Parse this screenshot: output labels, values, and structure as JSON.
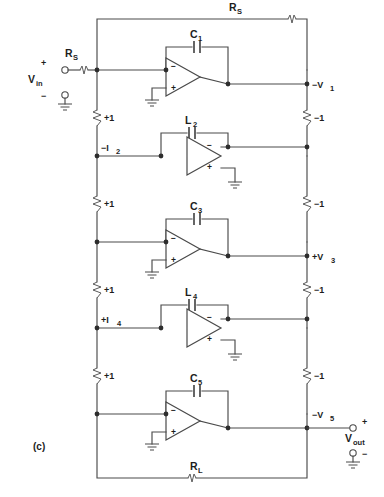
{
  "figure": {
    "label": "(c)",
    "caption_id": "c"
  },
  "source": {
    "signal_label": "V",
    "signal_sub": "in",
    "plus": "+",
    "minus": "−",
    "series_resistor": "R",
    "series_resistor_sub": "S"
  },
  "output": {
    "signal_label": "V",
    "signal_sub": "out",
    "plus": "+",
    "minus": "−"
  },
  "feedback": {
    "top_resistor": "R",
    "top_resistor_sub": "S",
    "bottom_resistor": "R",
    "bottom_resistor_sub": "L"
  },
  "stages": [
    {
      "component": "C",
      "component_sub": "1",
      "component_type": "capacitor",
      "orientation": "standard",
      "output_node": "−V",
      "output_node_sub": "1",
      "input_node": "",
      "input_node_sub": ""
    },
    {
      "component": "L",
      "component_sub": "2",
      "component_type": "capacitor",
      "orientation": "inverted",
      "output_node": "",
      "output_node_sub": "",
      "input_node": "−I",
      "input_node_sub": "2"
    },
    {
      "component": "C",
      "component_sub": "3",
      "component_type": "capacitor",
      "orientation": "standard",
      "output_node": "+V",
      "output_node_sub": "3",
      "input_node": "",
      "input_node_sub": ""
    },
    {
      "component": "L",
      "component_sub": "4",
      "component_type": "capacitor",
      "orientation": "inverted",
      "output_node": "",
      "output_node_sub": "",
      "input_node": "+I",
      "input_node_sub": "4"
    },
    {
      "component": "C",
      "component_sub": "5",
      "component_type": "capacitor",
      "orientation": "standard",
      "output_node": "−V",
      "output_node_sub": "5",
      "input_node": "",
      "input_node_sub": ""
    }
  ],
  "left_rail_resistors": [
    "+1",
    "+1",
    "+1",
    "+1"
  ],
  "right_rail_resistors": [
    "−1",
    "−1",
    "−1",
    "−1"
  ],
  "opamp_inputs": {
    "inverting": "−",
    "noninverting": "+"
  },
  "colors": {
    "wire": "#4a4a4a",
    "text": "#1d1d1d",
    "background": "#ffffff",
    "node": "#2d2d2d"
  }
}
